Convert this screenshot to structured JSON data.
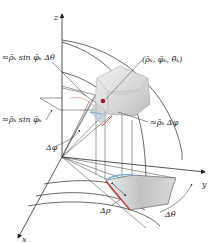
{
  "figure": {
    "type": "spherical-coordinates-volume-element",
    "axes": {
      "x_label": "x",
      "y_label": "y",
      "z_label": "z"
    },
    "labels": {
      "arc_theta": "≈ρ̄ₖ sin φ̄ₖ Δθ",
      "point": "(ρ̄ₖ, φ̄ₖ, θ̄ₖ)",
      "radius_sin": "≈ρ̄ₖ sin φ̄ₖ",
      "arc_phi": "≈ρ̄ₖ Δφ",
      "delta_phi": "Δφ",
      "delta_rho": "Δρ",
      "delta_theta": "Δθ"
    },
    "colors": {
      "line": "#2a2a2a",
      "wedge_fill": "#d9d9d9",
      "wedge_shadow": "#bfbfbf",
      "base_fill": "#b8b8b8",
      "highlight_blue": "#6fa8d8",
      "highlight_red": "#d23a2a",
      "point_red": "#a01818"
    }
  }
}
